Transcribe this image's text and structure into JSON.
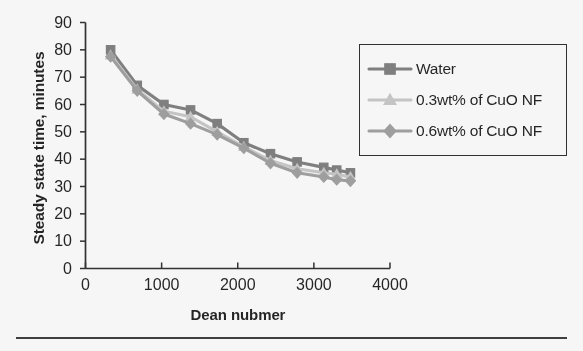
{
  "chart_data": {
    "type": "line",
    "title": "",
    "xlabel": "Dean nubmer",
    "ylabel": "Steady state time, minutes",
    "xlim": [
      0,
      4000
    ],
    "ylim": [
      0,
      90
    ],
    "xticks": [
      0,
      1000,
      2000,
      3000,
      4000
    ],
    "yticks": [
      0,
      10,
      20,
      30,
      40,
      50,
      60,
      70,
      80,
      90
    ],
    "grid": false,
    "legend_position": "upper-right",
    "x": [
      330,
      680,
      1030,
      1380,
      1730,
      2080,
      2430,
      2780,
      3130,
      3300,
      3480
    ],
    "series": [
      {
        "name": "Water",
        "marker": "square",
        "color": "#7f7f7f",
        "values": [
          80,
          67,
          60,
          58,
          53,
          46,
          42,
          39,
          37,
          36,
          35
        ]
      },
      {
        "name": "0.3wt% of CuO NF",
        "marker": "triangle",
        "color": "#c9c9c9",
        "values": [
          78,
          65.5,
          57.5,
          55.5,
          50,
          44.5,
          39.5,
          36.5,
          35,
          34.5,
          33.5
        ]
      },
      {
        "name": "0.6wt% of CuO NF",
        "marker": "diamond",
        "color": "#a0a0a0",
        "values": [
          77.5,
          65,
          56.5,
          53,
          49,
          44,
          38.5,
          35,
          33.5,
          32.5,
          32
        ]
      }
    ]
  },
  "legend": {
    "items": [
      {
        "label": "Water"
      },
      {
        "label": "0.3wt% of CuO NF"
      },
      {
        "label": "0.6wt% of CuO NF"
      }
    ]
  },
  "axes": {
    "y_title": "Steady state time, minutes",
    "x_title": "Dean nubmer",
    "y_tick_labels": [
      "90",
      "80",
      "70",
      "60",
      "50",
      "40",
      "30",
      "20",
      "10",
      "0"
    ],
    "x_tick_labels": [
      "0",
      "1000",
      "2000",
      "3000",
      "4000"
    ]
  },
  "colors": {
    "axis": "#2b2b2b",
    "text": "#1d1d1d",
    "series_water": "#7f7f7f",
    "series_03": "#c9c9c9",
    "series_06": "#a0a0a0"
  }
}
